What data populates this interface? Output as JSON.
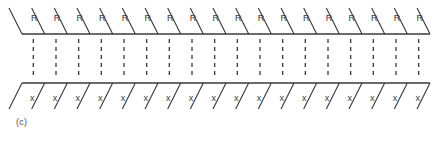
{
  "figure": {
    "caption": "(c)",
    "background_color": "#ffffff",
    "line_color": "#3a3a3a",
    "geometry": {
      "left_x": 22,
      "right_x": 430,
      "top_line_y": 34,
      "bottom_line_y": 83,
      "cell_count": 18,
      "cell_width": 22.7,
      "top_line_thickness": 1.6,
      "bottom_line_thickness": 1.6,
      "diagonal_rise": 26,
      "diagonal_run": 13,
      "dashed_line_dash": "4,4"
    },
    "top_row": {
      "label_text": "R",
      "slash_direction": "backslash",
      "position": "above-top-line",
      "labels": [
        "R",
        "R",
        "R",
        "R",
        "R",
        "R",
        "R",
        "R",
        "R",
        "R",
        "R",
        "R",
        "R",
        "R",
        "R",
        "R",
        "R",
        "R"
      ]
    },
    "middle_row": {
      "style": "dashed-vertical",
      "position": "between-lines",
      "count": 18
    },
    "bottom_row": {
      "label_text": "x",
      "slash_direction": "forwardslash",
      "position": "below-bottom-line",
      "labels": [
        "x",
        "x",
        "x",
        "x",
        "x",
        "x",
        "x",
        "x",
        "x",
        "x",
        "x",
        "x",
        "x",
        "x",
        "x",
        "x",
        "x",
        "x"
      ]
    }
  }
}
